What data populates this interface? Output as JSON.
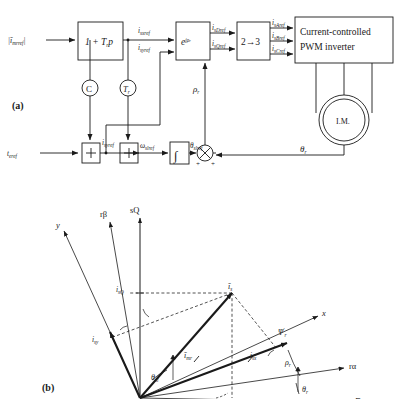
{
  "figure": {
    "panel_a_label": "(a)",
    "panel_b_label": "(b)"
  },
  "block_diagram": {
    "inputs": {
      "flux_ref": "|ī_mrref|",
      "torque_ref": "t_eref"
    },
    "blocks": [
      {
        "id": "lead",
        "label": "1 + T_r p"
      },
      {
        "id": "rotator",
        "label": "e^{jρ_r}"
      },
      {
        "id": "two_to_three",
        "label": "2→3"
      },
      {
        "id": "inverter",
        "label_line1": "Current-controlled",
        "label_line2": "PWM inverter"
      },
      {
        "id": "integrator",
        "label": "∫"
      },
      {
        "id": "machine",
        "label": "I.M."
      }
    ],
    "gain_nodes": [
      {
        "id": "gain-c",
        "label": "C"
      },
      {
        "id": "gain-tr",
        "label": "T_r"
      }
    ],
    "summing_nodes": [
      {
        "id": "sum-1",
        "symbol": "÷"
      },
      {
        "id": "sum-2",
        "symbol": "÷"
      },
      {
        "id": "sum-3",
        "symbol": "⊗",
        "sign_left": "+",
        "sign_right": "+"
      }
    ],
    "signals": {
      "i_sxref": "i_sxref",
      "i_syref_top": "i_syref",
      "i_sDref": "i_sDref",
      "i_sQref": "i_sQref",
      "i_sAref": "i_sAref",
      "i_sBref": "i_sBref",
      "i_sCref": "i_sCref",
      "rho_r": "ρ_r",
      "i_syref_bottom": "i_syref",
      "omega_slref": "ω_slref",
      "theta_slref": "θ_slref",
      "theta_r": "θ_r"
    }
  },
  "vector_diagram": {
    "axes": [
      {
        "id": "axis-y",
        "label": "y"
      },
      {
        "id": "axis-rbeta",
        "label": "rβ"
      },
      {
        "id": "axis-sq",
        "label": "sQ"
      },
      {
        "id": "axis-x",
        "label": "x"
      },
      {
        "id": "axis-ralpha",
        "label": "rα"
      },
      {
        "id": "axis-sd",
        "label": "sD"
      }
    ],
    "vectors": [
      {
        "id": "vec-is",
        "label": "ī_s"
      },
      {
        "id": "vec-imr",
        "label": "ī_mr"
      },
      {
        "id": "vec-psir",
        "label": "Ψ'_r"
      }
    ],
    "components": [
      {
        "id": "comp-isq",
        "label": "i_sQ"
      },
      {
        "id": "comp-isy",
        "label": "i_sy"
      },
      {
        "id": "comp-isx",
        "label": "i_sx"
      }
    ],
    "angles": [
      {
        "id": "angle-rho-r",
        "label": "ρ_r"
      },
      {
        "id": "angle-theta-sl",
        "label": "θ_sl"
      },
      {
        "id": "angle-theta-r",
        "label": "θ_r"
      }
    ]
  }
}
